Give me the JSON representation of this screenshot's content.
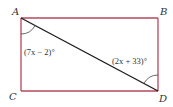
{
  "diagram": {
    "type": "rectangle-with-diagonal",
    "vertices": [
      {
        "id": "A",
        "label": "A",
        "x": 21,
        "y": 18,
        "label_x": 12,
        "label_y": 15
      },
      {
        "id": "B",
        "label": "B",
        "x": 158,
        "y": 18,
        "label_x": 160,
        "label_y": 15
      },
      {
        "id": "C",
        "label": "C",
        "x": 21,
        "y": 91,
        "label_x": 9,
        "label_y": 100
      },
      {
        "id": "D",
        "label": "D",
        "x": 158,
        "y": 91,
        "label_x": 159,
        "label_y": 102
      }
    ],
    "edges": [
      {
        "from": "A",
        "to": "B"
      },
      {
        "from": "B",
        "to": "D"
      },
      {
        "from": "D",
        "to": "C"
      },
      {
        "from": "C",
        "to": "A"
      }
    ],
    "diagonal": {
      "from": "A",
      "to": "D"
    },
    "angles": [
      {
        "vertex": "A",
        "between": [
          "AC",
          "AD"
        ],
        "expression": "(7x − 2)°"
      },
      {
        "vertex": "D",
        "between": [
          "DB",
          "DA"
        ],
        "expression": "(2x + 33)°"
      }
    ],
    "colors": {
      "rectangle": "#b5485a",
      "diagonal": "#1a1a1a",
      "arc": "#444444",
      "text": "#333333"
    }
  }
}
